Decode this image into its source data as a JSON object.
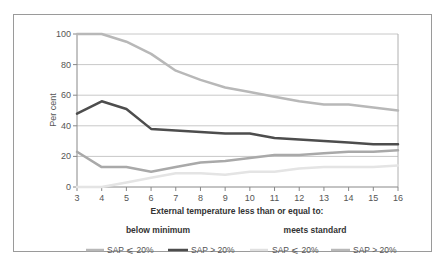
{
  "chart_data": {
    "type": "line",
    "title": "",
    "xlabel": "External temperature less than or equal to:",
    "ylabel": "Per cent",
    "ylim": [
      0,
      100
    ],
    "xlim": [
      3,
      16
    ],
    "grid": true,
    "x": [
      3,
      4,
      5,
      6,
      7,
      8,
      9,
      10,
      11,
      12,
      13,
      14,
      15,
      16
    ],
    "y_ticks": [
      0,
      20,
      40,
      60,
      80,
      100
    ],
    "legend_position": "bottom",
    "legend_groups": [
      {
        "label": "below minimum",
        "series_indices": [
          0,
          1
        ]
      },
      {
        "label": "meets standard",
        "series_indices": [
          2,
          3
        ]
      }
    ],
    "series": [
      {
        "name": "SAP ≤ 20%",
        "group": "below minimum",
        "color": "#b8b8b8",
        "width": 2.5,
        "values": [
          100,
          100,
          95,
          87,
          76,
          70,
          65,
          62,
          59,
          56,
          54,
          54,
          52,
          50
        ]
      },
      {
        "name": "SAP > 20%",
        "group": "below minimum",
        "color": "#4d4d4d",
        "width": 2.5,
        "values": [
          48,
          56,
          51,
          38,
          37,
          36,
          35,
          35,
          32,
          31,
          30,
          29,
          28,
          28
        ]
      },
      {
        "name": "SAP ≤ 20%",
        "group": "meets standard",
        "color": "#e4e4e4",
        "width": 2.5,
        "values": [
          0,
          0,
          3,
          6,
          9,
          9,
          8,
          10,
          10,
          12,
          13,
          13,
          13,
          14
        ]
      },
      {
        "name": "SAP > 20%",
        "group": "meets standard",
        "color": "#a9a9a9",
        "width": 2.5,
        "values": [
          23,
          13,
          13,
          10,
          13,
          16,
          17,
          19,
          21,
          21,
          22,
          23,
          23,
          24
        ]
      }
    ]
  },
  "legend": {
    "group_below": "below minimum",
    "group_meets": "meets standard",
    "items": [
      {
        "label": "SAP ⩽ 20%"
      },
      {
        "label": "SAP > 20%"
      },
      {
        "label": "SAP ⩽ 20%"
      },
      {
        "label": "SAP > 20%"
      }
    ]
  },
  "axes": {
    "ylabel": "Per cent",
    "xlabel": "External temperature less than or equal to:"
  }
}
